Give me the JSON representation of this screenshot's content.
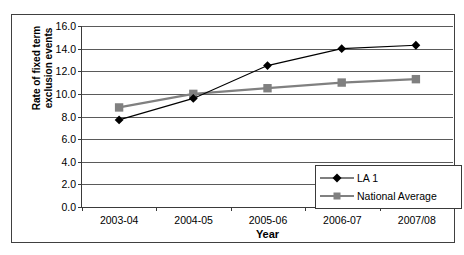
{
  "chart_data": {
    "type": "line",
    "title": "",
    "xlabel": "Year",
    "ylabel": "Rate of fixed term exclusion events",
    "ylabel_lines": [
      "Rate of fixed term",
      "exclusion events"
    ],
    "categories": [
      "2003-04",
      "2004-05",
      "2005-06",
      "2006-07",
      "2007/08"
    ],
    "ylim": [
      0.0,
      16.0
    ],
    "ytick_step": 2.0,
    "ytick_labels": [
      "16.0",
      "14.0",
      "12.0",
      "10.0",
      "8.0",
      "6.0",
      "4.0",
      "2.0",
      "0.0"
    ],
    "ytick_values": [
      16.0,
      14.0,
      12.0,
      10.0,
      8.0,
      6.0,
      4.0,
      2.0,
      0.0
    ],
    "grid": true,
    "grid_axis": "y",
    "legend_position": "bottom-right",
    "series": [
      {
        "name": "LA 1",
        "values": [
          7.7,
          9.6,
          12.5,
          14.0,
          14.3
        ],
        "color": "#000000",
        "marker": "diamond"
      },
      {
        "name": "National Average",
        "values": [
          8.8,
          10.0,
          10.5,
          11.0,
          11.3
        ],
        "color": "#808080",
        "marker": "square"
      }
    ]
  },
  "legend": {
    "items": [
      {
        "label": "LA 1"
      },
      {
        "label": "National Average"
      }
    ]
  },
  "colors": {
    "series_1": "#000000",
    "series_2": "#808080",
    "axis": "#3a3a3a",
    "grid": "#5a5a5a",
    "frame": "#404040",
    "background": "#ffffff"
  }
}
